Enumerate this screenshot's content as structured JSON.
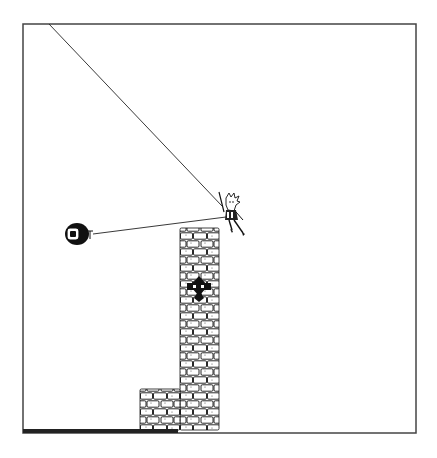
{
  "game": {
    "frame": {
      "x": 23,
      "y": 24,
      "width": 393,
      "height": 409,
      "border_color": "#444444"
    },
    "colors": {
      "background": "#ffffff",
      "ink": "#111111",
      "brick_fill": "#ffffff",
      "ground": "#222222"
    },
    "rope_main": {
      "x1": 49,
      "y1": 24,
      "x2": 222,
      "y2": 206
    },
    "rope_grapple": {
      "x1": 93,
      "y1": 234,
      "x2": 226,
      "y2": 217
    },
    "player": {
      "x": 221,
      "y": 194,
      "sprite": "swinging-character"
    },
    "enemy": {
      "cx": 77,
      "cy": 234,
      "sprite": "cannon-barrel"
    },
    "tower": {
      "x": 180,
      "y": 228,
      "width": 39,
      "height": 202,
      "emblem_y": 290
    },
    "block": {
      "x": 140,
      "y": 389,
      "width": 40,
      "height": 41
    },
    "ground_bar": {
      "x": 23,
      "y": 429,
      "width": 155,
      "height": 4
    }
  }
}
